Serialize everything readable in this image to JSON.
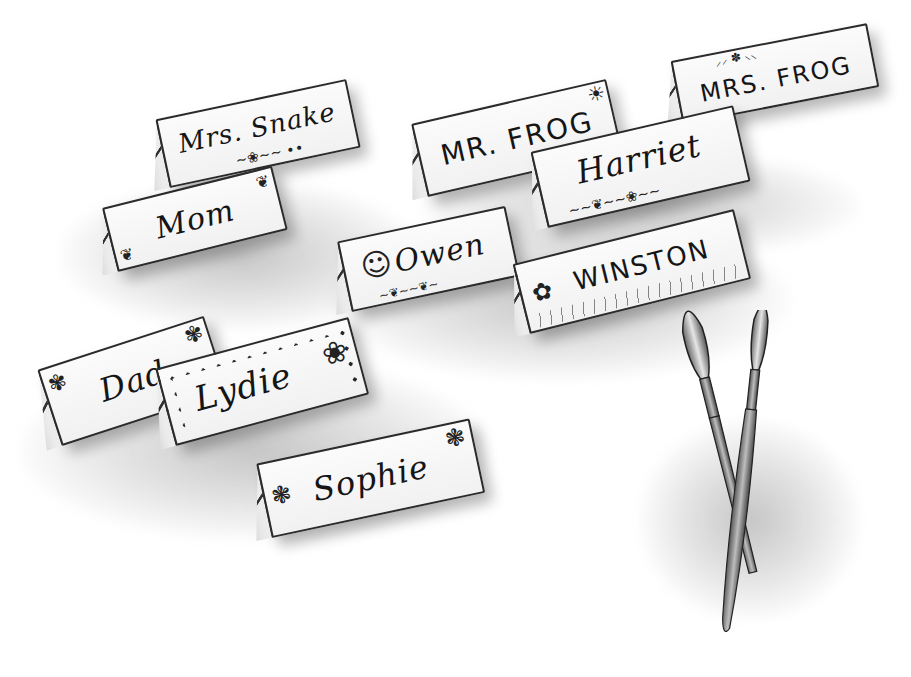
{
  "illustration": {
    "description": "Pencil sketch of folded place cards with hand-lettered names and two paintbrushes",
    "style": "graphite pencil, grayscale",
    "cards": [
      {
        "id": "mrs-snake",
        "name": "Mrs. Snake",
        "decoration": "vine with flower and dots"
      },
      {
        "id": "mr-frog",
        "name": "MR. FROG",
        "decoration": "sun in corner"
      },
      {
        "id": "mrs-frog",
        "name": "MRS. FROG",
        "decoration": "leaves along top"
      },
      {
        "id": "mom",
        "name": "Mom",
        "decoration": "leaves in corners"
      },
      {
        "id": "harriet",
        "name": "Harriet",
        "decoration": "flower and vine"
      },
      {
        "id": "owen",
        "name": "Owen",
        "decoration": "smiley face and leaves"
      },
      {
        "id": "winston",
        "name": "WINSTON",
        "decoration": "flower, sun and grass"
      },
      {
        "id": "dad",
        "name": "Dad",
        "decoration": "flowers in corners"
      },
      {
        "id": "lydie",
        "name": "Lydie",
        "decoration": "dotted border and flowers"
      },
      {
        "id": "sophie",
        "name": "Sophie",
        "decoration": "flowers"
      }
    ],
    "objects": [
      {
        "id": "paintbrush-1",
        "label": "paintbrush"
      },
      {
        "id": "paintbrush-2",
        "label": "paintbrush"
      }
    ]
  }
}
